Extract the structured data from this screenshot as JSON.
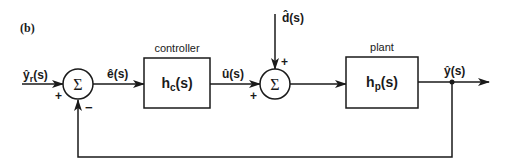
{
  "figure": {
    "panel_label": "(b)",
    "colors": {
      "ink": "#1a1a1a",
      "background": "#ffffff"
    }
  },
  "blocks": {
    "controller": {
      "title": "controller",
      "transfer_fn": "h",
      "subscript": "c",
      "arg": "(s)"
    },
    "plant": {
      "title": "plant",
      "transfer_fn": "h",
      "subscript": "p",
      "arg": "(s)"
    }
  },
  "junctions": {
    "sum1": {
      "symbol": "Σ",
      "in_plus": "+",
      "in_minus": "−"
    },
    "sum2": {
      "symbol": "Σ",
      "in_plus_left": "+",
      "in_plus_top": "+"
    }
  },
  "signals": {
    "reference": {
      "base": "ŷ",
      "subscript": "r",
      "arg": "(s)"
    },
    "error": {
      "base": "ê",
      "arg": "(s)"
    },
    "control": {
      "base": "û",
      "arg": "(s)"
    },
    "disturbance": {
      "base": "d̂",
      "arg": "(s)"
    },
    "output": {
      "base": "ŷ",
      "arg": "(s)"
    }
  }
}
